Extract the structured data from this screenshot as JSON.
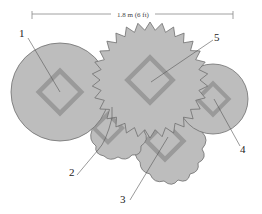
{
  "dimension": {
    "label": "1.8 m (6 ft)"
  },
  "colors": {
    "fill": "#bdbdbd",
    "stroke": "#6f6f6f",
    "diamond": "#9a9a9a",
    "leader": "#555555"
  },
  "callouts": [
    {
      "id": "1",
      "label": "1",
      "shape": "circle"
    },
    {
      "id": "2",
      "label": "2",
      "shape": "scalloped"
    },
    {
      "id": "3",
      "label": "3",
      "shape": "wavy"
    },
    {
      "id": "4",
      "label": "4",
      "shape": "circle"
    },
    {
      "id": "5",
      "label": "5",
      "shape": "star"
    }
  ]
}
